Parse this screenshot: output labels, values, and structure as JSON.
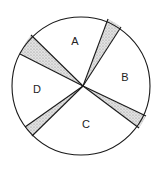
{
  "diagram": {
    "type": "circle-sector-diagram",
    "circle": {
      "cx": 81,
      "cy": 86,
      "r": 69
    },
    "center": {
      "x": 83,
      "y": 86
    },
    "colors": {
      "stroke": "#1a1a1a",
      "shading": "#9a9a9a",
      "background": "#ffffff"
    },
    "sectors": [
      {
        "id": "A",
        "label": "A",
        "label_pos": {
          "x": 75,
          "y": 45
        }
      },
      {
        "id": "B",
        "label": "B",
        "label_pos": {
          "x": 125,
          "y": 81
        }
      },
      {
        "id": "C",
        "label": "C",
        "label_pos": {
          "x": 86,
          "y": 128
        }
      },
      {
        "id": "D",
        "label": "D",
        "label_pos": {
          "x": 37,
          "y": 93
        }
      }
    ],
    "shaded_wedges": [
      {
        "name": "wedge-top-right",
        "p1": {
          "x": 108,
          "y": 19
        },
        "p2": {
          "x": 121,
          "y": 27
        }
      },
      {
        "name": "wedge-left-top",
        "p1": {
          "x": 31,
          "y": 35
        },
        "p2": {
          "x": 20,
          "y": 54
        }
      },
      {
        "name": "wedge-bottom-left",
        "p1": {
          "x": 25,
          "y": 127
        },
        "p2": {
          "x": 32,
          "y": 136
        }
      },
      {
        "name": "wedge-right",
        "p1": {
          "x": 146,
          "y": 116
        },
        "p2": {
          "x": 139,
          "y": 128
        }
      }
    ]
  }
}
